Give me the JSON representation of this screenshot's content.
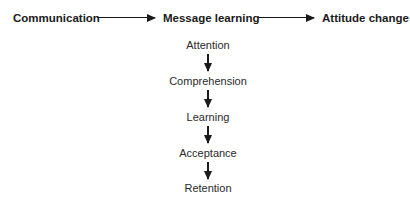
{
  "top_row": {
    "nodes": [
      "Communication",
      "Message learning",
      "Attitude change"
    ]
  },
  "stages": [
    "Attention",
    "Comprehension",
    "Learning",
    "Acceptance",
    "Retention"
  ]
}
